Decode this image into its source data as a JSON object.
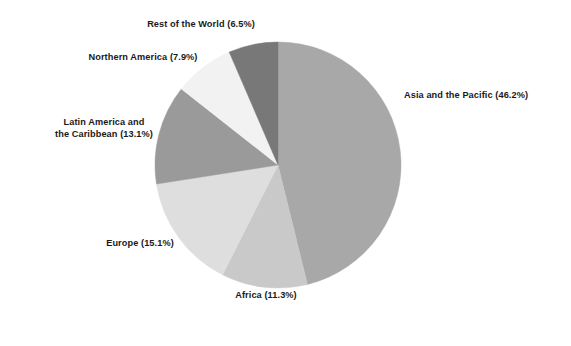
{
  "chart_data": {
    "type": "pie",
    "title": "",
    "subtitle": "",
    "xlabel": "",
    "ylabel": "",
    "legend_position": "none",
    "grid": false,
    "start_angle_deg": 0,
    "direction": "clockwise",
    "units": "percent",
    "categories": [
      "Asia and the Pacific",
      "Africa",
      "Europe",
      "Latin America and the Caribbean",
      "Northern America",
      "Rest of the World"
    ],
    "values": [
      46.2,
      11.3,
      15.1,
      13.1,
      7.9,
      6.5
    ],
    "colors": [
      "#a8a8a8",
      "#c9c9c9",
      "#dedede",
      "#9a9a9a",
      "#f2f2f2",
      "#787878"
    ],
    "labels": [
      "Asia and the Pacific (46.2%)",
      "Africa (11.3%)",
      "Europe (15.1%)",
      "Latin America and the Caribbean (13.1%)",
      "Northern America (7.9%)",
      "Rest of the World (6.5%)"
    ]
  },
  "slices": {
    "asia": {
      "name": "Asia and the Pacific",
      "value": 46.2,
      "label": "Asia and the Pacific (46.2%)",
      "color": "#a8a8a8"
    },
    "africa": {
      "name": "Africa",
      "value": 11.3,
      "label": "Africa (11.3%)",
      "color": "#c9c9c9"
    },
    "europe": {
      "name": "Europe",
      "value": 15.1,
      "label": "Europe (15.1%)",
      "color": "#dedede"
    },
    "latin_america": {
      "name": "Latin America and the Caribbean",
      "value": 13.1,
      "label_line1": "Latin America and",
      "label_line2": "the Caribbean (13.1%)",
      "color": "#9a9a9a"
    },
    "northern_america": {
      "name": "Northern America",
      "value": 7.9,
      "label": "Northern America (7.9%)",
      "color": "#f2f2f2"
    },
    "rest_of_world": {
      "name": "Rest of the World",
      "value": 6.5,
      "label": "Rest of the World (6.5%)",
      "color": "#787878"
    }
  }
}
